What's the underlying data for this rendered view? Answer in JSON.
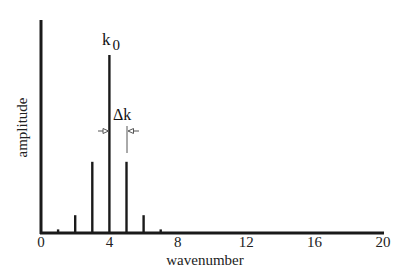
{
  "chart_data": {
    "type": "bar",
    "title": "",
    "xlabel": "wavenumber",
    "ylabel": "amplitude",
    "xlim": [
      0,
      20
    ],
    "ylim": [
      0,
      1.2
    ],
    "x_ticks": [
      0,
      4,
      8,
      12,
      16,
      20
    ],
    "x_tick_labels": [
      "0",
      "4",
      "8",
      "12",
      "16",
      "20"
    ],
    "y_ticks": [],
    "grid": false,
    "legend": null,
    "categories": [
      1,
      2,
      3,
      4,
      5,
      6,
      7
    ],
    "values": [
      0.02,
      0.1,
      0.4,
      1.0,
      0.4,
      0.1,
      0.02
    ],
    "annotations": [
      {
        "text": "k",
        "subscript": "0",
        "x": 4,
        "note": "peak wavenumber label"
      },
      {
        "text": "Δk",
        "x_from": 4,
        "x_to": 5,
        "note": "spacing between adjacent wavenumbers"
      }
    ]
  },
  "labels": {
    "xlabel": "wavenumber",
    "ylabel": "amplitude",
    "peak_label": "k",
    "peak_subscript": "0",
    "delta_label": "Δk",
    "ticks": [
      "0",
      "4",
      "8",
      "12",
      "16",
      "20"
    ]
  },
  "colors": {
    "axis": "#1a1a1a",
    "bars": "#1a1a1a",
    "annotation": "#555555"
  }
}
